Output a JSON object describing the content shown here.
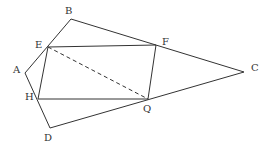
{
  "diagram": {
    "type": "geometry",
    "stroke_color": "#333333",
    "background": "#ffffff",
    "points": {
      "A": {
        "x": 25,
        "y": 73,
        "label": "A",
        "lx": 13,
        "ly": 65
      },
      "B": {
        "x": 71,
        "y": 19,
        "label": "B",
        "lx": 65,
        "ly": 6
      },
      "C": {
        "x": 244,
        "y": 72,
        "label": "C",
        "lx": 251,
        "ly": 63
      },
      "D": {
        "x": 50,
        "y": 128,
        "label": "D",
        "lx": 44,
        "ly": 133
      },
      "E": {
        "x": 48,
        "y": 47,
        "label": "E",
        "lx": 35,
        "ly": 40
      },
      "F": {
        "x": 156,
        "y": 45,
        "label": "F",
        "lx": 162,
        "ly": 37
      },
      "H": {
        "x": 38,
        "y": 99,
        "label": "H",
        "lx": 25,
        "ly": 92
      },
      "Q": {
        "x": 148,
        "y": 99,
        "label": "Q",
        "lx": 143,
        "ly": 104
      }
    },
    "segments": [
      {
        "from": "A",
        "to": "B",
        "style": "solid"
      },
      {
        "from": "B",
        "to": "C",
        "style": "solid"
      },
      {
        "from": "C",
        "to": "D",
        "style": "solid"
      },
      {
        "from": "D",
        "to": "A",
        "style": "solid"
      },
      {
        "from": "E",
        "to": "F",
        "style": "solid"
      },
      {
        "from": "F",
        "to": "Q",
        "style": "solid"
      },
      {
        "from": "Q",
        "to": "H",
        "style": "solid"
      },
      {
        "from": "H",
        "to": "E",
        "style": "solid"
      },
      {
        "from": "E",
        "to": "Q",
        "style": "dashed"
      }
    ],
    "labels": [
      "A",
      "B",
      "C",
      "D",
      "E",
      "F",
      "H",
      "Q"
    ]
  }
}
